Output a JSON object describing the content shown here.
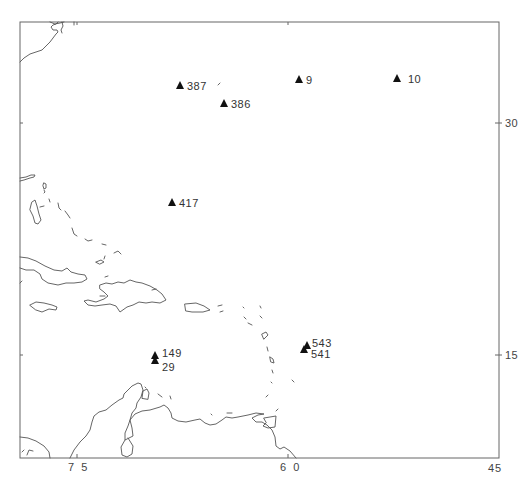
{
  "map": {
    "region": "Caribbean / Western North Atlantic",
    "x_axis": {
      "ticks": [
        {
          "label": "7 5",
          "value": 75
        },
        {
          "label": "6 0",
          "value": 60
        },
        {
          "label": "45",
          "value": 45
        }
      ]
    },
    "y_axis": {
      "ticks": [
        {
          "label": "30",
          "value": 30
        },
        {
          "label": "15",
          "value": 15
        }
      ]
    },
    "stations": [
      {
        "id": "387",
        "label": "387"
      },
      {
        "id": "386",
        "label": "386"
      },
      {
        "id": "9",
        "label": "9"
      },
      {
        "id": "10",
        "label": "10"
      },
      {
        "id": "417",
        "label": "417"
      },
      {
        "id": "149",
        "label": "149"
      },
      {
        "id": "29",
        "label": "29"
      },
      {
        "id": "543",
        "label": "543"
      },
      {
        "id": "541",
        "label": "541"
      }
    ],
    "marker_symbol": "filled-triangle",
    "marker_color": "#111111",
    "coast_color": "#555555"
  }
}
